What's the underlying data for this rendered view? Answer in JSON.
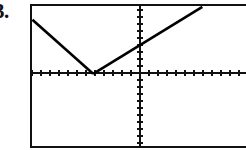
{
  "item": {
    "number_label": "3."
  },
  "screen": {
    "name": "graphing-calculator-screen",
    "frame_color": "#111111",
    "background_color": "#ffffff",
    "curve_color": "#000000"
  },
  "chart_data": {
    "type": "line",
    "title": "",
    "subtitle": "",
    "xlabel": "",
    "ylabel": "",
    "grid": false,
    "legend": null,
    "axes": {
      "x_axis_pixel_y": 69,
      "y_axis_pixel_x": 110,
      "xlim": [
        -11.8,
        14.9
      ],
      "ylim": [
        -10.3,
        9.7
      ],
      "x_tick_step": 1,
      "y_tick_step": 1,
      "x_tick_count": 24,
      "y_tick_count": 20
    },
    "series": [
      {
        "name": "absolute-value-branch-left",
        "equation": "y = -(x + 4)  for x <= -4",
        "points": [
          {
            "x": -11.5,
            "y": 7.5
          },
          {
            "x": -4.0,
            "y": 0.0
          }
        ]
      },
      {
        "name": "absolute-value-branch-right",
        "equation": "y = x + 4  for x >= -4",
        "points": [
          {
            "x": -4.0,
            "y": 0.0
          },
          {
            "x": 9.5,
            "y": 9.3
          }
        ]
      }
    ],
    "vertex": {
      "x": -4.0,
      "y": 0.0
    },
    "annotations": []
  }
}
